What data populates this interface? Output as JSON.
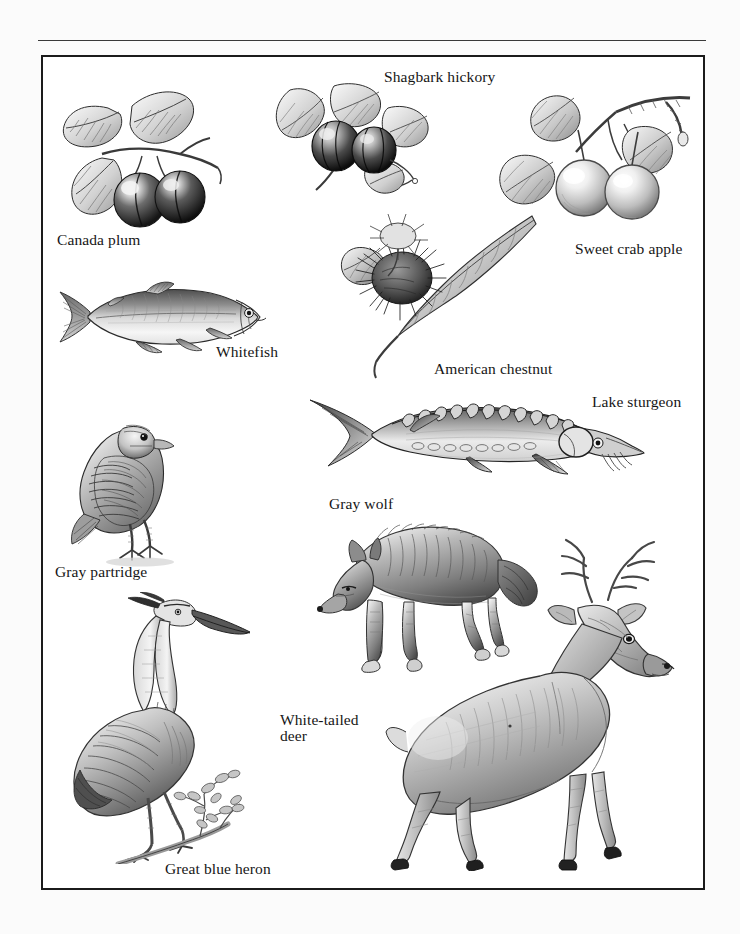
{
  "page": {
    "background_color": "#fbfbfb",
    "plate_background_color": "#ffffff",
    "frame_color": "#1b1b1b",
    "rule_color": "#3a3a3a",
    "ink_color": "#161616"
  },
  "plate": {
    "kind": "natural-history illustration plate",
    "medium": "graphite / pencil shaded line drawings",
    "palette": "grayscale"
  },
  "captions": [
    {
      "id": "canada-plum",
      "label": "Canada plum",
      "x": 57,
      "y": 232,
      "lines": [
        "Canada plum"
      ]
    },
    {
      "id": "shagbark-hickory",
      "label": "Shagbark hickory",
      "x": 384,
      "y": 69,
      "lines": [
        "Shagbark hickory"
      ]
    },
    {
      "id": "sweet-crab-apple",
      "label": "Sweet crab apple",
      "x": 575,
      "y": 241,
      "lines": [
        "Sweet crab apple"
      ]
    },
    {
      "id": "whitefish",
      "label": "Whitefish",
      "x": 216,
      "y": 344,
      "lines": [
        "Whitefish"
      ]
    },
    {
      "id": "american-chestnut",
      "label": "American chestnut",
      "x": 434,
      "y": 361,
      "lines": [
        "American chestnut"
      ]
    },
    {
      "id": "lake-sturgeon",
      "label": "Lake sturgeon",
      "x": 592,
      "y": 394,
      "lines": [
        "Lake sturgeon"
      ]
    },
    {
      "id": "gray-wolf",
      "label": "Gray wolf",
      "x": 329,
      "y": 496,
      "lines": [
        "Gray wolf"
      ]
    },
    {
      "id": "gray-partridge",
      "label": "Gray partridge",
      "x": 55,
      "y": 564,
      "lines": [
        "Gray partridge"
      ]
    },
    {
      "id": "white-tailed-deer",
      "label": "White-tailed deer",
      "x": 280,
      "y": 712,
      "lines": [
        "White-tailed",
        "deer"
      ]
    },
    {
      "id": "great-blue-heron",
      "label": "Great blue heron",
      "x": 165,
      "y": 861,
      "lines": [
        "Great blue heron"
      ]
    }
  ],
  "figures": [
    {
      "id": "canada-plum",
      "subject": "Canada plum",
      "description": "branch with two serrated leaves and two dark round plums",
      "x": 58,
      "y": 72,
      "w": 170,
      "h": 160
    },
    {
      "id": "shagbark-hickory",
      "subject": "Shagbark hickory",
      "description": "twig with compound leaves and two ribbed hickory nut husks",
      "x": 272,
      "y": 80,
      "w": 160,
      "h": 140
    },
    {
      "id": "sweet-crab-apple",
      "subject": "Sweet crab apple",
      "description": "branch with leaves, woody spur and two pale crab apples",
      "x": 500,
      "y": 78,
      "w": 195,
      "h": 160
    },
    {
      "id": "american-chestnut",
      "subject": "American chestnut",
      "description": "branch with long toothed leaves and spiny chestnut burr",
      "x": 340,
      "y": 215,
      "w": 200,
      "h": 160
    },
    {
      "id": "whitefish",
      "subject": "Whitefish",
      "description": "lake whitefish in left profile, forked tail, small head",
      "x": 52,
      "y": 282,
      "w": 215,
      "h": 70
    },
    {
      "id": "lake-sturgeon",
      "subject": "Lake sturgeon",
      "description": "lake sturgeon in right profile with dorsal scutes and barbels",
      "x": 310,
      "y": 393,
      "w": 335,
      "h": 95
    },
    {
      "id": "gray-partridge",
      "subject": "Gray partridge",
      "description": "standing partridge, barred flank feathers, facing right",
      "x": 72,
      "y": 405,
      "w": 120,
      "h": 160
    },
    {
      "id": "gray-wolf",
      "subject": "Gray wolf",
      "description": "gray wolf walking left, head lowered",
      "x": 318,
      "y": 512,
      "w": 220,
      "h": 160
    },
    {
      "id": "white-tailed-deer",
      "subject": "White-tailed deer",
      "description": "white-tailed buck with antlers, standing in right profile",
      "x": 360,
      "y": 530,
      "w": 330,
      "h": 335
    },
    {
      "id": "great-blue-heron",
      "subject": "Great blue heron",
      "description": "great blue heron perched on a leafy branch",
      "x": 62,
      "y": 595,
      "w": 230,
      "h": 265
    }
  ]
}
